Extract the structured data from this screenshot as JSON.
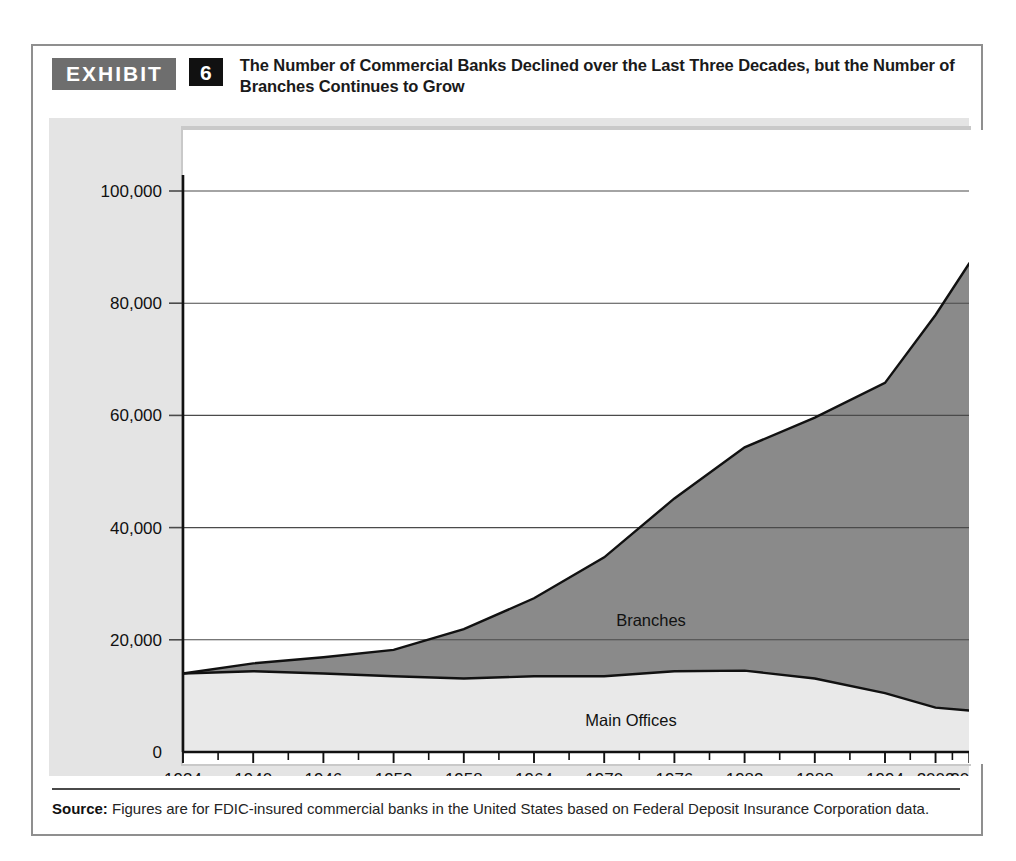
{
  "exhibit": {
    "badge_label": "EXHIBIT",
    "number": "6",
    "title": "The Number of Commercial Banks Declined over the Last Three Decades, but the Number of Branches Continues to Grow"
  },
  "source": {
    "label": "Source:",
    "text": " Figures are for FDIC-insured commercial banks in the United States based on Federal Deposit Insurance Corporation data."
  },
  "colors": {
    "branches_fill": "#8a8a8a",
    "main_offices_fill": "#e9e9e9",
    "plot_background": "#ffffff",
    "panel_background": "#e4e4e4",
    "gridline": "#4a4a4a",
    "axis": "#111111",
    "badge_background": "#6e6e6e",
    "number_background": "#111111"
  },
  "chart_data": {
    "type": "area",
    "title": "The Number of Commercial Banks Declined over the Last Three Decades, but the Number of Branches Continues to Grow",
    "xlabel": "",
    "ylabel": "",
    "stacked": true,
    "grid": true,
    "legend": "inline-labels",
    "xlim": [
      1934,
      2009
    ],
    "ylim": [
      0,
      100000
    ],
    "yticks": [
      0,
      20000,
      40000,
      60000,
      80000,
      100000
    ],
    "ytick_labels": [
      "0",
      "20,000",
      "40,000",
      "60,000",
      "80,000",
      "100,000"
    ],
    "xticks": [
      1934,
      1940,
      1946,
      1952,
      1958,
      1964,
      1970,
      1976,
      1982,
      1988,
      1994,
      2002,
      2006,
      2009
    ],
    "xtick_labels": [
      "1934",
      "1940",
      "1946",
      "1952",
      "1958",
      "1964",
      "1970",
      "1976",
      "1982",
      "1988",
      "1994",
      "2002",
      "2006",
      "2009"
    ],
    "minor_xticks": [
      1937,
      1943,
      1949,
      1955,
      1961,
      1967,
      1973,
      1979,
      1985,
      1991,
      1998,
      2004,
      2008
    ],
    "x": [
      1934,
      1940,
      1946,
      1952,
      1958,
      1964,
      1970,
      1976,
      1982,
      1988,
      1994,
      2002,
      2006,
      2009
    ],
    "series": [
      {
        "name": "Main Offices",
        "label": "Main Offices",
        "fill": "#e9e9e9",
        "values": [
          14000,
          14400,
          14000,
          13500,
          13100,
          13500,
          13500,
          14400,
          14500,
          13100,
          10500,
          7900,
          7400,
          6800
        ]
      },
      {
        "name": "Branches",
        "label": "Branches",
        "fill": "#8a8a8a",
        "values": [
          0,
          1400,
          2900,
          4700,
          8800,
          13900,
          21200,
          30800,
          39800,
          46500,
          55300,
          70000,
          79700,
          81200
        ],
        "note": "stacked on top of Main Offices; cumulative top of band reaches ~88,000 in 2009"
      }
    ],
    "stack_totals": [
      14000,
      15800,
      16900,
      18200,
      21900,
      27400,
      34700,
      45200,
      54300,
      59600,
      65800,
      77900,
      87100,
      88000
    ]
  }
}
